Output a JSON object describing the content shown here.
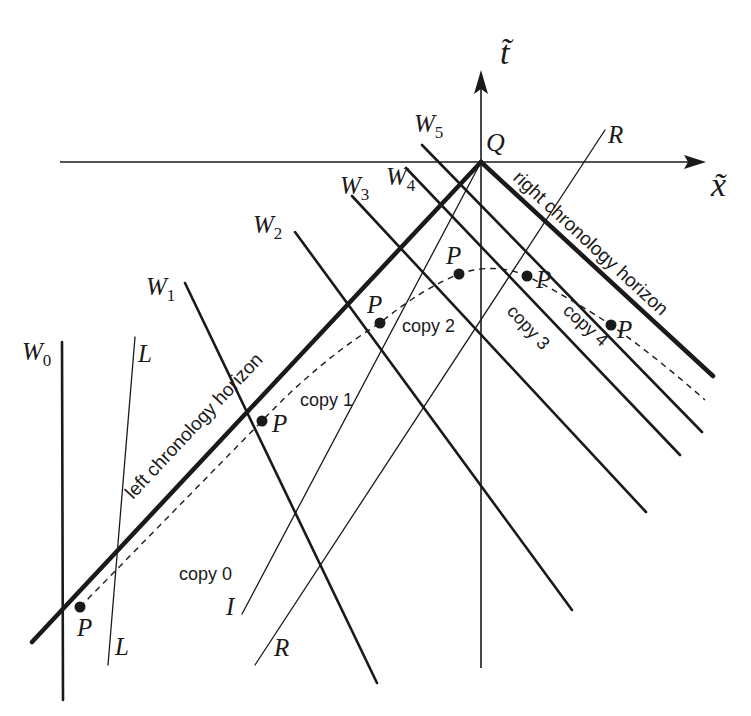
{
  "axes": {
    "x_label": "x̃",
    "t_label": "t̃",
    "origin_label": "Q"
  },
  "horizons": {
    "left_label": "left chronology horizon",
    "right_label": "right chronology horizon"
  },
  "worldlines": [
    {
      "label": "W",
      "sub": "0"
    },
    {
      "label": "W",
      "sub": "1"
    },
    {
      "label": "W",
      "sub": "2"
    },
    {
      "label": "W",
      "sub": "3"
    },
    {
      "label": "W",
      "sub": "4"
    },
    {
      "label": "W",
      "sub": "5"
    }
  ],
  "lines": {
    "L_top": "L",
    "L_bottom": "L",
    "I": "I",
    "R_top": "R",
    "R_bottom": "R"
  },
  "particle": {
    "label": "P",
    "points": [
      "P",
      "P",
      "P",
      "P",
      "P",
      "P"
    ]
  },
  "copies": [
    "copy 0",
    "copy 1",
    "copy 2",
    "copy 3",
    "copy 4"
  ],
  "colors": {
    "ink": "#1a1a1a",
    "background": "#ffffff"
  }
}
